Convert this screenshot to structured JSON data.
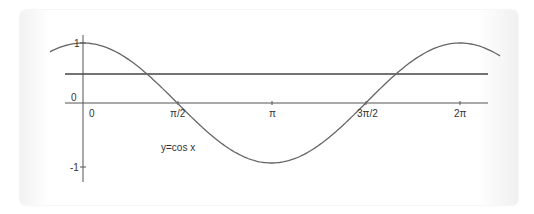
{
  "chart_data": {
    "type": "line",
    "title": "",
    "annotation": "y=cos x",
    "xlabel": "",
    "ylabel": "",
    "x_ticks": [
      "0",
      "π/2",
      "π",
      "3π/2",
      "2π"
    ],
    "x_tick_values": [
      0,
      1.5708,
      3.1416,
      4.7124,
      6.2832
    ],
    "y_ticks": [
      "1",
      "0",
      "-1"
    ],
    "y_tick_values": [
      1,
      0,
      -1
    ],
    "xlim": [
      -0.55,
      6.95
    ],
    "ylim": [
      -1.3,
      1.1
    ],
    "grid": false,
    "series": [
      {
        "name": "y=cos x",
        "function": "cos(x)",
        "x_range": [
          -0.55,
          6.95
        ]
      },
      {
        "name": "horizontal line",
        "function": "y=0.5",
        "x_range": [
          -0.55,
          6.95
        ]
      }
    ]
  },
  "labels": {
    "curve": "y=cos x",
    "y1": "1",
    "y0": "0",
    "yneg1": "-1",
    "x0": "0",
    "xpi2": "π/2",
    "xpi": "π",
    "x3pi2": "3π/2",
    "x2pi": "2π"
  },
  "colors": {
    "curve": "#666666",
    "axis": "#555555",
    "line": "#444444"
  }
}
